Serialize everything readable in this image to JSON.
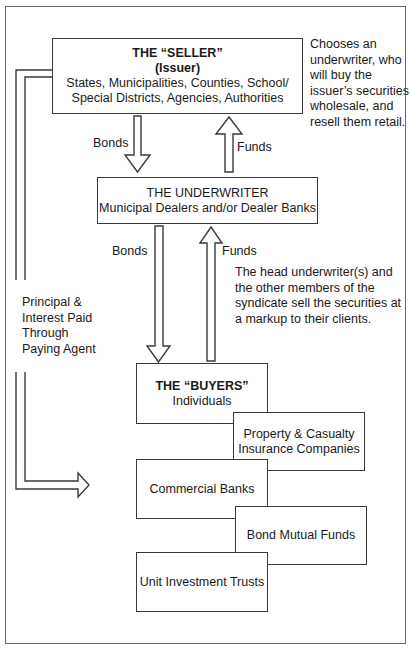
{
  "diagram": {
    "seller": {
      "title": "THE “SELLER”",
      "subtitle": "(Issuer)",
      "line1": "States, Municipalities, Counties, School/",
      "line2": "Special Districts, Agencies, Authorities"
    },
    "seller_note": [
      "Chooses an",
      "underwriter, who",
      "will buy the",
      "issuer’s securities",
      "wholesale, and",
      "resell them retail."
    ],
    "underwriter": {
      "title": "THE UNDERWRITER",
      "line1": "Municipal Dealers and/or Dealer Banks"
    },
    "underwriter_note": [
      "The head underwriter(s) and",
      "the other members of the",
      "syndicate sell the securities at",
      "a markup to their clients."
    ],
    "arrows": {
      "bonds_top": "Bonds",
      "funds_top": "Funds",
      "bonds_bottom": "Bonds",
      "funds_bottom": "Funds"
    },
    "return_label": [
      "Principal &",
      "Interest Paid",
      "Through",
      "Paying Agent"
    ],
    "buyers": {
      "title": "THE “BUYERS”",
      "line1": "Individuals"
    },
    "buyer_types": {
      "pc_line1": "Property & Casualty",
      "pc_line2": "Insurance Companies",
      "commercial_banks": "Commercial Banks",
      "bond_mutual_funds": "Bond Mutual Funds",
      "unit_investment_trusts": "Unit Investment Trusts"
    }
  }
}
